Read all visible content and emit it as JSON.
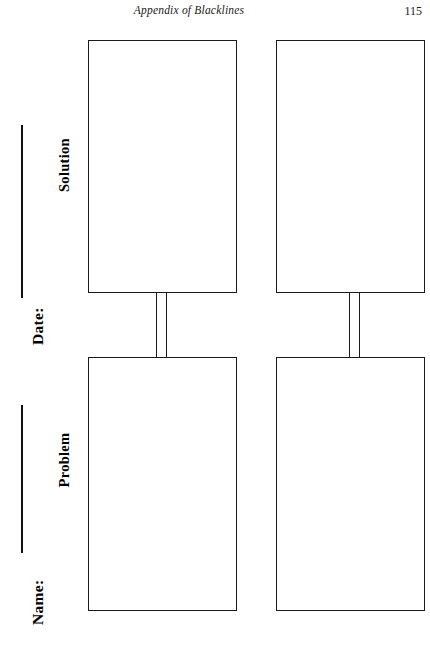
{
  "page": {
    "running_title": "Appendix of Blacklines",
    "folio": "115"
  },
  "margin_fields": [
    {
      "label": "Date:"
    },
    {
      "label": "Name:"
    }
  ],
  "organizer": {
    "columns": [
      {
        "heading": "Solution",
        "top_box_text": "",
        "bottom_box_text": ""
      },
      {
        "heading": "Problem",
        "top_box_text": "",
        "bottom_box_text": ""
      }
    ],
    "rows": [
      {
        "heading": "Solution"
      },
      {
        "heading": "Problem"
      }
    ],
    "box_count": "4",
    "connector_count": "2"
  },
  "colors": {
    "ink": "#1b1b1b",
    "paper": "#ffffff"
  }
}
